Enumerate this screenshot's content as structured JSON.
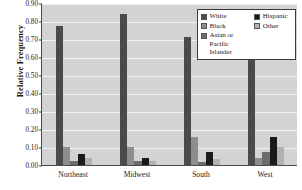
{
  "chart_data": {
    "type": "bar",
    "title": "",
    "subtitle": "",
    "xlabel": "",
    "ylabel": "Relative Frequency",
    "categories": [
      "Northeast",
      "Midwest",
      "South",
      "West"
    ],
    "series": [
      {
        "name": "White",
        "color": "#4a4a4a",
        "values": [
          0.77,
          0.84,
          0.71,
          0.64
        ]
      },
      {
        "name": "Black",
        "color": "#8d8d8d",
        "values": [
          0.1,
          0.1,
          0.155,
          0.04
        ]
      },
      {
        "name": "Asian or\nPacific Islander",
        "color": "#6c6c6c",
        "values": [
          0.02,
          0.02,
          0.015,
          0.075
        ]
      },
      {
        "name": "Hispanic",
        "color": "#1a1a1a",
        "values": [
          0.06,
          0.04,
          0.07,
          0.155
        ]
      },
      {
        "name": "Other",
        "color": "#b2b2b2",
        "values": [
          0.04,
          0.025,
          0.035,
          0.1
        ]
      }
    ],
    "ylim": [
      0.0,
      0.9
    ],
    "ytick_values": [
      0.0,
      0.1,
      0.2,
      0.3,
      0.4,
      0.5,
      0.6,
      0.7,
      0.8,
      0.9
    ],
    "ytick_labels": [
      "0.00",
      "0.10",
      "0.20",
      "0.30",
      "0.40",
      "0.50",
      "0.60",
      "0.70",
      "0.80",
      "0.90"
    ],
    "grid": true,
    "grid_axis": "y",
    "grid_color": "#f2f2f2",
    "plot_background": "#d3d3d3",
    "figure_background": "#ffffff",
    "axis_color": "#4a4a4a",
    "legend": {
      "position": "top-right",
      "columns": 2,
      "background": "#ffffff",
      "border_color": "#3a3a3a",
      "entries_left": [
        "White",
        "Black",
        "Asian or\nPacific Islander"
      ],
      "entries_right": [
        "Hispanic",
        "Other"
      ]
    }
  }
}
